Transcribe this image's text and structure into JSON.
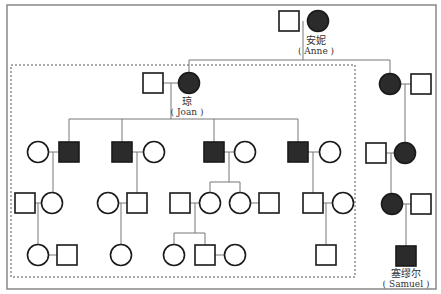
{
  "diagram": {
    "type": "pedigree",
    "colors": {
      "affected": "#2b2b2b",
      "unaffected": "#ffffff",
      "stroke": "#1a1a1a",
      "line": "#777777",
      "frame": "#888888"
    },
    "people": [
      {
        "id": "anne-husband",
        "sex": "male",
        "affected": false,
        "x": 289,
        "y": 21
      },
      {
        "id": "anne",
        "sex": "female",
        "affected": true,
        "x": 318,
        "y": 21
      },
      {
        "id": "joan-husband",
        "sex": "male",
        "affected": false,
        "x": 153,
        "y": 83
      },
      {
        "id": "joan",
        "sex": "female",
        "affected": true,
        "x": 189,
        "y": 83
      },
      {
        "id": "anne-daughter2",
        "sex": "female",
        "affected": true,
        "x": 390,
        "y": 84
      },
      {
        "id": "anne-daughter2-husband",
        "sex": "male",
        "affected": false,
        "x": 421,
        "y": 84
      },
      {
        "id": "g2-1-wife",
        "sex": "female",
        "affected": false,
        "x": 38,
        "y": 152
      },
      {
        "id": "g2-1",
        "sex": "male",
        "affected": true,
        "x": 69,
        "y": 152
      },
      {
        "id": "g2-2",
        "sex": "male",
        "affected": true,
        "x": 122,
        "y": 152
      },
      {
        "id": "g2-2-wife",
        "sex": "female",
        "affected": false,
        "x": 154,
        "y": 152
      },
      {
        "id": "g2-3",
        "sex": "male",
        "affected": true,
        "x": 214,
        "y": 152
      },
      {
        "id": "g2-3-wife",
        "sex": "female",
        "affected": false,
        "x": 245,
        "y": 152
      },
      {
        "id": "g2-4",
        "sex": "male",
        "affected": true,
        "x": 298,
        "y": 152
      },
      {
        "id": "g2-4-wife",
        "sex": "female",
        "affected": false,
        "x": 330,
        "y": 152
      },
      {
        "id": "r-g3-husband",
        "sex": "male",
        "affected": false,
        "x": 376,
        "y": 153
      },
      {
        "id": "r-g3",
        "sex": "female",
        "affected": true,
        "x": 405,
        "y": 153
      },
      {
        "id": "g3-1-husband",
        "sex": "male",
        "affected": false,
        "x": 25,
        "y": 203
      },
      {
        "id": "g3-1",
        "sex": "female",
        "affected": false,
        "x": 52,
        "y": 203
      },
      {
        "id": "g3-2-wife",
        "sex": "female",
        "affected": false,
        "x": 108,
        "y": 203
      },
      {
        "id": "g3-2",
        "sex": "male",
        "affected": false,
        "x": 137,
        "y": 203
      },
      {
        "id": "g3-3-husband",
        "sex": "male",
        "affected": false,
        "x": 180,
        "y": 203
      },
      {
        "id": "g3-3",
        "sex": "female",
        "affected": false,
        "x": 210,
        "y": 203
      },
      {
        "id": "g3-4",
        "sex": "female",
        "affected": false,
        "x": 240,
        "y": 203
      },
      {
        "id": "g3-4-husband",
        "sex": "male",
        "affected": false,
        "x": 269,
        "y": 203
      },
      {
        "id": "g3-5",
        "sex": "male",
        "affected": false,
        "x": 313,
        "y": 203
      },
      {
        "id": "g3-5-wife",
        "sex": "female",
        "affected": false,
        "x": 343,
        "y": 203
      },
      {
        "id": "r-g4",
        "sex": "female",
        "affected": true,
        "x": 392,
        "y": 204
      },
      {
        "id": "r-g4-husband",
        "sex": "male",
        "affected": false,
        "x": 421,
        "y": 204
      },
      {
        "id": "g4-1",
        "sex": "female",
        "affected": false,
        "x": 38,
        "y": 255
      },
      {
        "id": "g4-1-husband",
        "sex": "male",
        "affected": false,
        "x": 67,
        "y": 255
      },
      {
        "id": "g4-2",
        "sex": "female",
        "affected": false,
        "x": 121,
        "y": 255
      },
      {
        "id": "g4-3",
        "sex": "female",
        "affected": false,
        "x": 174,
        "y": 255
      },
      {
        "id": "g4-4",
        "sex": "male",
        "affected": false,
        "x": 205,
        "y": 255
      },
      {
        "id": "g4-4-wife",
        "sex": "female",
        "affected": false,
        "x": 235,
        "y": 255
      },
      {
        "id": "g4-5",
        "sex": "male",
        "affected": false,
        "x": 326,
        "y": 255
      },
      {
        "id": "samuel",
        "sex": "male",
        "affected": true,
        "x": 406,
        "y": 256
      }
    ],
    "lines": [
      [
        303,
        21,
        303,
        60
      ],
      [
        189,
        60,
        390,
        60
      ],
      [
        189,
        60,
        189,
        73
      ],
      [
        390,
        60,
        390,
        74
      ],
      [
        153,
        83,
        189,
        83
      ],
      [
        171,
        83,
        171,
        119
      ],
      [
        69,
        119,
        298,
        119
      ],
      [
        69,
        119,
        69,
        142
      ],
      [
        122,
        119,
        122,
        142
      ],
      [
        214,
        119,
        214,
        142
      ],
      [
        298,
        119,
        298,
        142
      ],
      [
        390,
        84,
        421,
        84
      ],
      [
        405,
        84,
        405,
        143
      ],
      [
        38,
        152,
        69,
        152
      ],
      [
        53,
        152,
        53,
        193
      ],
      [
        122,
        152,
        154,
        152
      ],
      [
        137,
        152,
        137,
        193
      ],
      [
        214,
        152,
        245,
        152
      ],
      [
        229,
        152,
        229,
        182
      ],
      [
        210,
        182,
        240,
        182
      ],
      [
        210,
        182,
        210,
        193
      ],
      [
        240,
        182,
        240,
        193
      ],
      [
        298,
        152,
        330,
        152
      ],
      [
        313,
        152,
        313,
        193
      ],
      [
        376,
        153,
        405,
        153
      ],
      [
        391,
        153,
        391,
        194
      ],
      [
        25,
        203,
        52,
        203
      ],
      [
        38,
        203,
        38,
        245
      ],
      [
        108,
        203,
        137,
        203
      ],
      [
        121,
        203,
        121,
        245
      ],
      [
        180,
        203,
        210,
        203
      ],
      [
        195,
        203,
        195,
        233
      ],
      [
        174,
        233,
        205,
        233
      ],
      [
        174,
        233,
        174,
        245
      ],
      [
        205,
        233,
        205,
        245
      ],
      [
        240,
        203,
        269,
        203
      ],
      [
        313,
        203,
        343,
        203
      ],
      [
        326,
        203,
        326,
        245
      ],
      [
        392,
        204,
        421,
        204
      ],
      [
        406,
        204,
        406,
        246
      ],
      [
        38,
        255,
        67,
        255
      ],
      [
        205,
        255,
        235,
        255
      ]
    ],
    "frame": {
      "x": 7,
      "y": 5,
      "w": 429,
      "h": 284
    },
    "dashed_box": {
      "x": 11,
      "y": 65,
      "w": 344,
      "h": 212
    },
    "labels": {
      "anne": {
        "zh": "安妮",
        "en": "( Anne )",
        "x": 316,
        "y": 35
      },
      "joan": {
        "zh": "琼",
        "en": "( Joan )",
        "x": 187,
        "y": 96
      },
      "samuel": {
        "zh": "塞缪尔",
        "en": "( Samuel )",
        "x": 406,
        "y": 268
      }
    }
  }
}
